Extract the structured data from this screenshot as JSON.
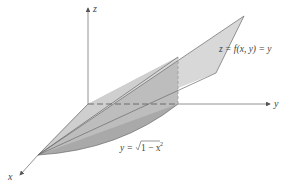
{
  "figure": {
    "type": "3d-surface-region",
    "axes": {
      "x_label": "x",
      "y_label": "y",
      "z_label": "z"
    },
    "annotations": {
      "surface_label": "z = f(x, y) = y",
      "curve_label_prefix": "y = ",
      "curve_label_radical": "1 − x",
      "curve_label_exponent": "2"
    },
    "colors": {
      "axis": "#777777",
      "surface_fill": "#d6d6d6",
      "wall_fill": "#b8b8b8",
      "base_fill": "#a8a8a8",
      "edge": "#555555",
      "text": "#444444"
    }
  }
}
